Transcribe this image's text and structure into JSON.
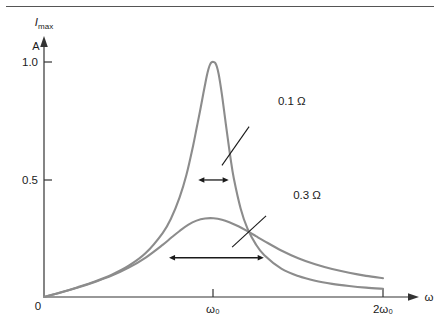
{
  "figure": {
    "top_rule": true,
    "background_color": "#ffffff",
    "axis_color": "#333333",
    "curve_color": "#8c8c8c",
    "annotation_color": "#1a1a1a"
  },
  "chart_data": {
    "type": "line",
    "title": "",
    "subtitle": "",
    "xlabel": "ω",
    "ylabel": "I_max",
    "ylabel_unit": "A",
    "grid": false,
    "legend_position": "inline-annotations",
    "xlim": [
      0,
      2.12
    ],
    "ylim": [
      0,
      1.12
    ],
    "x_tick_values": [
      0,
      1,
      2
    ],
    "x_tick_labels": [
      "0",
      "ω₀",
      "2ω₀"
    ],
    "y_tick_values": [
      0,
      0.5,
      1.0
    ],
    "y_tick_labels": [
      "0",
      "0.5",
      "1.0"
    ],
    "resonance_frequency": 1.0,
    "series": [
      {
        "name": "0.1 Ω",
        "resistance": 0.1,
        "peak_x": 1.0,
        "peak_y": 1.0,
        "fwhm": 0.1,
        "half_max_y": 0.5,
        "x": [
          0.0,
          0.1,
          0.2,
          0.3,
          0.4,
          0.5,
          0.6,
          0.7,
          0.75,
          0.8,
          0.84,
          0.88,
          0.9,
          0.92,
          0.94,
          0.95,
          0.96,
          0.97,
          0.98,
          0.99,
          1.0,
          1.01,
          1.02,
          1.03,
          1.04,
          1.05,
          1.06,
          1.08,
          1.1,
          1.12,
          1.16,
          1.2,
          1.25,
          1.3,
          1.4,
          1.5,
          1.6,
          1.7,
          1.8,
          1.9,
          2.0
        ],
        "y": [
          0.0,
          0.02,
          0.042,
          0.066,
          0.095,
          0.133,
          0.187,
          0.272,
          0.335,
          0.424,
          0.519,
          0.645,
          0.717,
          0.789,
          0.866,
          0.903,
          0.939,
          0.969,
          0.99,
          0.999,
          1.0,
          0.996,
          0.98,
          0.95,
          0.908,
          0.86,
          0.806,
          0.697,
          0.593,
          0.504,
          0.377,
          0.292,
          0.224,
          0.178,
          0.121,
          0.089,
          0.069,
          0.056,
          0.047,
          0.04,
          0.035
        ]
      },
      {
        "name": "0.3 Ω",
        "resistance": 0.3,
        "peak_x": 1.0,
        "peak_y": 0.335,
        "fwhm": 0.3,
        "half_max_y": 0.167,
        "x": [
          0.0,
          0.1,
          0.2,
          0.3,
          0.4,
          0.5,
          0.6,
          0.7,
          0.75,
          0.8,
          0.85,
          0.9,
          0.95,
          1.0,
          1.05,
          1.1,
          1.15,
          1.2,
          1.25,
          1.3,
          1.4,
          1.5,
          1.6,
          1.7,
          1.8,
          1.9,
          2.0
        ],
        "y": [
          0.0,
          0.019,
          0.04,
          0.064,
          0.091,
          0.125,
          0.168,
          0.222,
          0.252,
          0.281,
          0.307,
          0.325,
          0.334,
          0.335,
          0.329,
          0.316,
          0.3,
          0.28,
          0.259,
          0.238,
          0.198,
          0.165,
          0.139,
          0.119,
          0.103,
          0.09,
          0.08
        ]
      }
    ],
    "annotations": [
      {
        "name": "label-0.1-ohm",
        "text": "0.1 Ω",
        "text_x": 1.38,
        "text_y": 0.818,
        "leader_from_x": 1.21,
        "leader_from_y": 0.725,
        "leader_to_x": 1.05,
        "leader_to_y": 0.56
      },
      {
        "name": "label-0.3-ohm",
        "text": "0.3 Ω",
        "text_x": 1.47,
        "text_y": 0.418,
        "leader_from_x": 1.31,
        "leader_from_y": 0.345,
        "leader_to_x": 1.11,
        "leader_to_y": 0.212
      },
      {
        "name": "fwhm-arrow-narrow",
        "kind": "double-arrow",
        "x_start": 0.945,
        "x_end": 1.055,
        "y": 0.498
      },
      {
        "name": "fwhm-arrow-broad",
        "kind": "double-arrow",
        "x_start": 0.772,
        "x_end": 1.262,
        "y": 0.167
      }
    ]
  }
}
